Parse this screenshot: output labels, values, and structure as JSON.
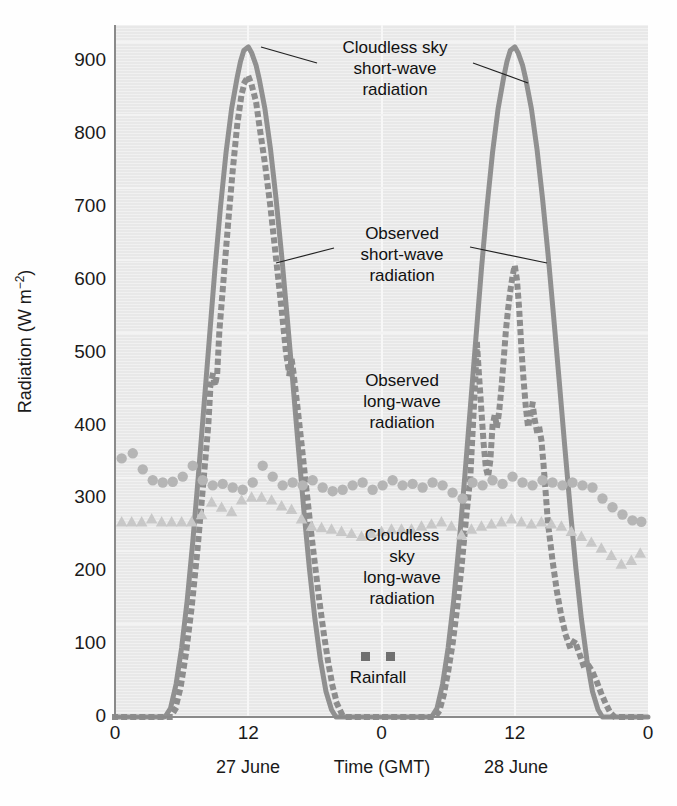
{
  "chart_data": {
    "type": "line",
    "title": "",
    "xlabel": "Time (GMT)",
    "ylabel": "Radiation (W m−2)",
    "ylabel_base": "Radiation (W m",
    "ylabel_sup": "−2",
    "ylabel_tail": ")",
    "xlim": [
      0,
      48
    ],
    "ylim": [
      0,
      950
    ],
    "grid": true,
    "legend_position": "inline-annotations",
    "y_ticks": [
      0,
      100,
      200,
      300,
      400,
      500,
      600,
      700,
      800,
      900
    ],
    "y_tick_labels": [
      "0",
      "100",
      "200",
      "300",
      "400",
      "500",
      "600",
      "700",
      "800",
      "900"
    ],
    "x_ticks": [
      0,
      12,
      24,
      36,
      48
    ],
    "x_tick_labels": [
      "0",
      "12",
      "0",
      "12",
      "0"
    ],
    "x_day_labels": [
      {
        "text": "27 June",
        "x": 12
      },
      {
        "text": "28 June",
        "x": 36
      }
    ],
    "annotations": [
      {
        "name": "cloudless-sky-short-wave",
        "text": "Cloudless sky\nshort-wave\nradiation"
      },
      {
        "name": "observed-short-wave",
        "text": "Observed\nshort-wave\nradiation"
      },
      {
        "name": "observed-long-wave",
        "text": "Observed\nlong-wave\nradiation"
      },
      {
        "name": "cloudless-sky-long-wave",
        "text": "Cloudless\nsky\nlong-wave\nradiation"
      },
      {
        "name": "rainfall",
        "text": "Rainfall"
      }
    ],
    "colors": {
      "plot_background": "#e8e8e8",
      "gridline": "#f6f6f6",
      "axis": "#8a8a8a",
      "solid_curve": "#909090",
      "dotted_curve": "#8d8d8d",
      "circle_marker": "#b5b5b5",
      "triangle_marker": "#c8c8c8",
      "rainfall_marker": "#6f6f6f",
      "text": "#1a1a1a"
    },
    "series": [
      {
        "name": "Cloudless sky short-wave radiation",
        "style": "solid",
        "color": "#909090",
        "points": [
          [
            0,
            0
          ],
          [
            4.5,
            0
          ],
          [
            5.0,
            12
          ],
          [
            5.5,
            45
          ],
          [
            6.0,
            95
          ],
          [
            6.5,
            160
          ],
          [
            7.0,
            240
          ],
          [
            7.5,
            330
          ],
          [
            8.0,
            425
          ],
          [
            8.5,
            520
          ],
          [
            9.0,
            615
          ],
          [
            9.5,
            700
          ],
          [
            10.0,
            775
          ],
          [
            10.5,
            835
          ],
          [
            11.0,
            878
          ],
          [
            11.3,
            900
          ],
          [
            11.6,
            915
          ],
          [
            12.0,
            920
          ],
          [
            12.3,
            912
          ],
          [
            12.7,
            895
          ],
          [
            13.0,
            875
          ],
          [
            13.5,
            835
          ],
          [
            14.0,
            780
          ],
          [
            14.5,
            712
          ],
          [
            15.0,
            635
          ],
          [
            15.5,
            550
          ],
          [
            16.0,
            462
          ],
          [
            16.5,
            372
          ],
          [
            17.0,
            285
          ],
          [
            17.5,
            205
          ],
          [
            18.0,
            135
          ],
          [
            18.5,
            78
          ],
          [
            19.0,
            35
          ],
          [
            19.5,
            10
          ],
          [
            19.9,
            0
          ],
          [
            20.5,
            0
          ],
          [
            24,
            0
          ],
          [
            28.5,
            0
          ],
          [
            29.0,
            12
          ],
          [
            29.5,
            45
          ],
          [
            30.0,
            95
          ],
          [
            30.5,
            160
          ],
          [
            31.0,
            240
          ],
          [
            31.5,
            330
          ],
          [
            32.0,
            425
          ],
          [
            32.5,
            520
          ],
          [
            33.0,
            615
          ],
          [
            33.5,
            700
          ],
          [
            34.0,
            775
          ],
          [
            34.5,
            835
          ],
          [
            35.0,
            878
          ],
          [
            35.3,
            900
          ],
          [
            35.6,
            915
          ],
          [
            36.0,
            920
          ],
          [
            36.3,
            912
          ],
          [
            36.7,
            895
          ],
          [
            37.0,
            875
          ],
          [
            37.5,
            835
          ],
          [
            38.0,
            780
          ],
          [
            38.5,
            712
          ],
          [
            39.0,
            635
          ],
          [
            39.5,
            550
          ],
          [
            40.0,
            462
          ],
          [
            40.5,
            372
          ],
          [
            41.0,
            285
          ],
          [
            41.5,
            205
          ],
          [
            42.0,
            135
          ],
          [
            42.5,
            78
          ],
          [
            43.0,
            35
          ],
          [
            43.5,
            10
          ],
          [
            43.9,
            0
          ],
          [
            44.5,
            0
          ],
          [
            48,
            0
          ]
        ]
      },
      {
        "name": "Observed short-wave radiation",
        "style": "dotted",
        "color": "#8d8d8d",
        "points": [
          [
            0,
            0
          ],
          [
            5.0,
            0
          ],
          [
            5.4,
            10
          ],
          [
            5.9,
            40
          ],
          [
            6.4,
            88
          ],
          [
            6.9,
            150
          ],
          [
            7.4,
            225
          ],
          [
            7.9,
            312
          ],
          [
            8.4,
            400
          ],
          [
            8.6,
            455
          ],
          [
            8.8,
            470
          ],
          [
            9.0,
            455
          ],
          [
            9.2,
            470
          ],
          [
            9.4,
            530
          ],
          [
            9.8,
            605
          ],
          [
            10.2,
            680
          ],
          [
            10.6,
            750
          ],
          [
            11.0,
            812
          ],
          [
            11.4,
            855
          ],
          [
            11.7,
            872
          ],
          [
            12.0,
            880
          ],
          [
            12.3,
            868
          ],
          [
            12.7,
            845
          ],
          [
            13.0,
            812
          ],
          [
            13.5,
            760
          ],
          [
            14.0,
            700
          ],
          [
            14.5,
            630
          ],
          [
            15.0,
            560
          ],
          [
            15.4,
            500
          ],
          [
            15.7,
            470
          ],
          [
            15.9,
            492
          ],
          [
            16.1,
            470
          ],
          [
            16.4,
            430
          ],
          [
            16.8,
            375
          ],
          [
            17.2,
            318
          ],
          [
            17.6,
            262
          ],
          [
            18.0,
            210
          ],
          [
            18.4,
            160
          ],
          [
            18.8,
            115
          ],
          [
            19.2,
            75
          ],
          [
            19.6,
            42
          ],
          [
            20.0,
            18
          ],
          [
            20.4,
            5
          ],
          [
            20.8,
            0
          ],
          [
            24,
            0
          ],
          [
            28.8,
            0
          ],
          [
            29.2,
            8
          ],
          [
            29.6,
            30
          ],
          [
            30.0,
            62
          ],
          [
            30.4,
            100
          ],
          [
            30.8,
            148
          ],
          [
            31.2,
            205
          ],
          [
            31.6,
            270
          ],
          [
            32.0,
            330
          ],
          [
            32.2,
            390
          ],
          [
            32.4,
            450
          ],
          [
            32.6,
            512
          ],
          [
            32.8,
            465
          ],
          [
            33.0,
            420
          ],
          [
            33.2,
            375
          ],
          [
            33.4,
            342
          ],
          [
            33.6,
            330
          ],
          [
            33.8,
            352
          ],
          [
            34.0,
            400
          ],
          [
            34.2,
            415
          ],
          [
            34.4,
            398
          ],
          [
            34.6,
            420
          ],
          [
            34.8,
            452
          ],
          [
            35.0,
            490
          ],
          [
            35.2,
            530
          ],
          [
            35.4,
            560
          ],
          [
            35.6,
            585
          ],
          [
            35.8,
            605
          ],
          [
            36.0,
            620
          ],
          [
            36.2,
            600
          ],
          [
            36.4,
            560
          ],
          [
            36.6,
            505
          ],
          [
            36.8,
            462
          ],
          [
            37.0,
            425
          ],
          [
            37.2,
            398
          ],
          [
            37.4,
            412
          ],
          [
            37.6,
            430
          ],
          [
            37.8,
            408
          ],
          [
            38.0,
            392
          ],
          [
            38.2,
            398
          ],
          [
            38.4,
            380
          ],
          [
            38.6,
            345
          ],
          [
            38.8,
            305
          ],
          [
            39.0,
            265
          ],
          [
            39.4,
            215
          ],
          [
            39.8,
            172
          ],
          [
            40.2,
            138
          ],
          [
            40.6,
            112
          ],
          [
            41.0,
            95
          ],
          [
            41.4,
            105
          ],
          [
            41.8,
            88
          ],
          [
            42.2,
            70
          ],
          [
            42.6,
            72
          ],
          [
            43.0,
            62
          ],
          [
            43.4,
            48
          ],
          [
            43.8,
            32
          ],
          [
            44.2,
            18
          ],
          [
            44.6,
            6
          ],
          [
            45.0,
            0
          ],
          [
            48,
            0
          ]
        ]
      },
      {
        "name": "Observed long-wave radiation",
        "style": "circles",
        "color": "#b5b5b5",
        "points": [
          [
            0.6,
            355
          ],
          [
            1.6,
            362
          ],
          [
            2.5,
            340
          ],
          [
            3.4,
            325
          ],
          [
            4.3,
            322
          ],
          [
            5.2,
            323
          ],
          [
            6.1,
            330
          ],
          [
            7.0,
            345
          ],
          [
            7.9,
            325
          ],
          [
            8.8,
            318
          ],
          [
            9.7,
            320
          ],
          [
            10.6,
            315
          ],
          [
            11.5,
            312
          ],
          [
            12.4,
            322
          ],
          [
            13.3,
            345
          ],
          [
            14.2,
            330
          ],
          [
            15.1,
            318
          ],
          [
            16.0,
            322
          ],
          [
            16.9,
            318
          ],
          [
            17.8,
            325
          ],
          [
            18.7,
            315
          ],
          [
            19.6,
            310
          ],
          [
            20.5,
            312
          ],
          [
            21.4,
            318
          ],
          [
            22.3,
            322
          ],
          [
            23.2,
            312
          ],
          [
            24.1,
            318
          ],
          [
            25.0,
            325
          ],
          [
            25.9,
            318
          ],
          [
            26.8,
            320
          ],
          [
            27.7,
            315
          ],
          [
            28.6,
            322
          ],
          [
            29.5,
            318
          ],
          [
            30.4,
            308
          ],
          [
            31.3,
            300
          ],
          [
            32.2,
            322
          ],
          [
            33.1,
            318
          ],
          [
            34.0,
            325
          ],
          [
            34.9,
            320
          ],
          [
            35.8,
            330
          ],
          [
            36.7,
            322
          ],
          [
            37.6,
            318
          ],
          [
            38.5,
            325
          ],
          [
            39.4,
            322
          ],
          [
            40.3,
            318
          ],
          [
            41.2,
            322
          ],
          [
            42.1,
            318
          ],
          [
            43.0,
            315
          ],
          [
            43.9,
            300
          ],
          [
            44.8,
            288
          ],
          [
            45.7,
            278
          ],
          [
            46.6,
            270
          ],
          [
            47.4,
            268
          ]
        ]
      },
      {
        "name": "Cloudless sky long-wave radiation",
        "style": "triangles",
        "color": "#c8c8c8",
        "points": [
          [
            0.6,
            268
          ],
          [
            1.5,
            268
          ],
          [
            2.4,
            268
          ],
          [
            3.3,
            272
          ],
          [
            4.2,
            268
          ],
          [
            5.1,
            268
          ],
          [
            6.0,
            268
          ],
          [
            6.9,
            268
          ],
          [
            7.8,
            278
          ],
          [
            8.7,
            295
          ],
          [
            9.6,
            288
          ],
          [
            10.5,
            282
          ],
          [
            11.4,
            298
          ],
          [
            12.3,
            302
          ],
          [
            13.2,
            302
          ],
          [
            14.1,
            298
          ],
          [
            15.0,
            290
          ],
          [
            15.9,
            285
          ],
          [
            16.8,
            272
          ],
          [
            17.7,
            262
          ],
          [
            18.6,
            260
          ],
          [
            19.5,
            258
          ],
          [
            20.4,
            255
          ],
          [
            21.3,
            252
          ],
          [
            22.2,
            248
          ],
          [
            23.1,
            252
          ],
          [
            24.0,
            255
          ],
          [
            24.9,
            258
          ],
          [
            25.8,
            258
          ],
          [
            26.7,
            258
          ],
          [
            27.6,
            262
          ],
          [
            28.5,
            265
          ],
          [
            29.4,
            268
          ],
          [
            30.3,
            262
          ],
          [
            31.2,
            250
          ],
          [
            32.1,
            258
          ],
          [
            33.0,
            262
          ],
          [
            33.9,
            265
          ],
          [
            34.8,
            268
          ],
          [
            35.7,
            272
          ],
          [
            36.6,
            268
          ],
          [
            37.5,
            265
          ],
          [
            38.4,
            268
          ],
          [
            39.3,
            265
          ],
          [
            40.2,
            262
          ],
          [
            41.1,
            255
          ],
          [
            42.0,
            248
          ],
          [
            42.9,
            240
          ],
          [
            43.8,
            232
          ],
          [
            44.7,
            222
          ],
          [
            45.6,
            210
          ],
          [
            46.5,
            215
          ],
          [
            47.3,
            225
          ]
        ]
      }
    ],
    "rainfall_legend_markers": 2
  }
}
